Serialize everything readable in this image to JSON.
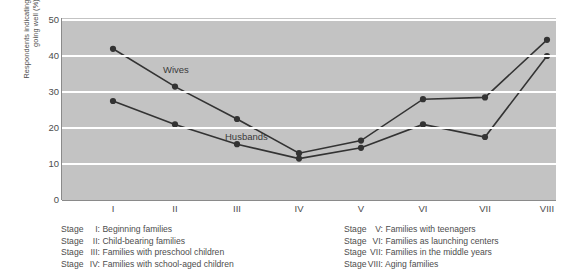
{
  "chart_data": {
    "type": "line",
    "title": "",
    "xlabel": "",
    "ylabel": "Respondents indicating marriage going well (%)",
    "ylabel_line1": "Respondents indicating marriage",
    "ylabel_line2": "going well (%)",
    "categories": [
      "I",
      "II",
      "III",
      "IV",
      "V",
      "VI",
      "VII",
      "VIII"
    ],
    "ylim": [
      0,
      50
    ],
    "yticks": [
      0,
      10,
      20,
      30,
      40,
      50
    ],
    "grid": "horizontal-white-gridlines-at-10-20-30-40-50",
    "legend_position": "inline-labels-on-plot",
    "series": [
      {
        "name": "Wives",
        "values": [
          42.0,
          31.5,
          22.5,
          13.0,
          16.5,
          28.0,
          28.5,
          44.5
        ],
        "color": "#333333",
        "marker": "filled-circle"
      },
      {
        "name": "Husbands",
        "values": [
          27.5,
          21.0,
          15.5,
          11.5,
          14.5,
          21.0,
          17.5,
          40.0
        ],
        "color": "#333333",
        "marker": "filled-circle"
      }
    ],
    "annotations": [
      {
        "text": "Wives",
        "x_category": "II",
        "y_value": 36.0
      },
      {
        "text": "Husbands",
        "x_category": "III",
        "y_value": 17.5
      }
    ],
    "plot_background": "#c3c3c3",
    "gridline_color": "#ffffff"
  },
  "caption": {
    "left_column": [
      {
        "word": "Stage",
        "numeral": "I:",
        "text": "Beginning families"
      },
      {
        "word": "Stage",
        "numeral": "II:",
        "text": "Child-bearing families"
      },
      {
        "word": "Stage",
        "numeral": "III:",
        "text": "Families with preschool children"
      },
      {
        "word": "Stage",
        "numeral": "IV:",
        "text": "Families with school-aged children"
      }
    ],
    "right_column": [
      {
        "word": "Stage",
        "numeral": "V:",
        "text": "Families with teenagers"
      },
      {
        "word": "Stage",
        "numeral": "VI:",
        "text": "Families as launching centers"
      },
      {
        "word": "Stage",
        "numeral": "VII:",
        "text": "Families in the middle years"
      },
      {
        "word": "Stage",
        "numeral": "VIII:",
        "text": "Aging families"
      }
    ]
  }
}
